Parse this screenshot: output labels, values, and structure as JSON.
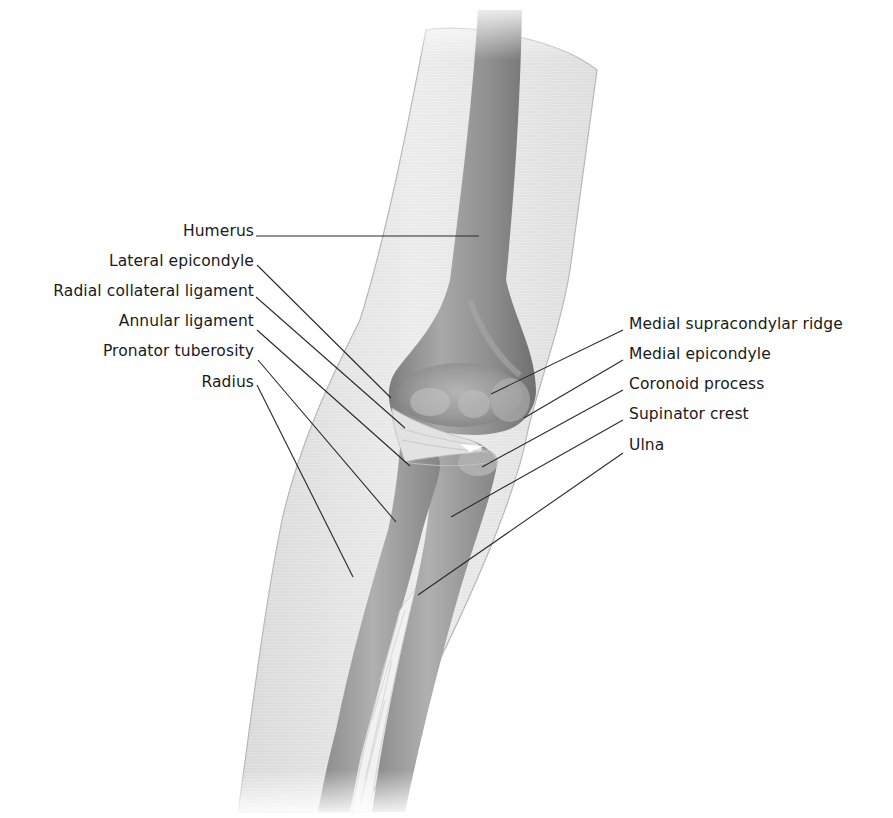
{
  "figure": {
    "colors": {
      "background": "#ffffff",
      "skin": "#e4e4e4",
      "skin_edge": "#b5b5b5",
      "bone": "#9a9a9a",
      "bone_dark": "#7c7c7c",
      "bone_light": "#bdbdbd",
      "ligament": "#dcdcdc",
      "leader_line": "#2a2a2a",
      "text": "#1a1a1a"
    }
  },
  "labels": {
    "left": [
      {
        "text": "Humerus",
        "x": 254,
        "y": 229
      },
      {
        "text": "Lateral epicondyle",
        "x": 254,
        "y": 260
      },
      {
        "text": "Radial collateral ligament",
        "x": 254,
        "y": 290
      },
      {
        "text": "Annular ligament",
        "x": 254,
        "y": 320
      },
      {
        "text": "Pronator tuberosity",
        "x": 254,
        "y": 350
      },
      {
        "text": "Radius",
        "x": 254,
        "y": 381
      }
    ],
    "right": [
      {
        "text": "Medial supracondylar ridge",
        "x": 629,
        "y": 323
      },
      {
        "text": "Medial epicondyle",
        "x": 629,
        "y": 353
      },
      {
        "text": "Coronoid process",
        "x": 629,
        "y": 383
      },
      {
        "text": "Supinator crest",
        "x": 629,
        "y": 413
      },
      {
        "text": "Ulna",
        "x": 629,
        "y": 443
      }
    ]
  },
  "leaders": {
    "left": [
      {
        "x1": 256,
        "y1": 236,
        "x2": 479,
        "y2": 236
      },
      {
        "x1": 257,
        "y1": 265,
        "x2": 391,
        "y2": 398
      },
      {
        "x1": 256,
        "y1": 297,
        "x2": 405,
        "y2": 428
      },
      {
        "x1": 257,
        "y1": 330,
        "x2": 410,
        "y2": 466
      },
      {
        "x1": 258,
        "y1": 360,
        "x2": 396,
        "y2": 522
      },
      {
        "x1": 257,
        "y1": 385,
        "x2": 353,
        "y2": 577
      }
    ],
    "right": [
      {
        "x1": 623,
        "y1": 330,
        "x2": 491,
        "y2": 394
      },
      {
        "x1": 623,
        "y1": 360,
        "x2": 524,
        "y2": 418
      },
      {
        "x1": 623,
        "y1": 390,
        "x2": 482,
        "y2": 467
      },
      {
        "x1": 623,
        "y1": 420,
        "x2": 451,
        "y2": 517
      },
      {
        "x1": 623,
        "y1": 453,
        "x2": 418,
        "y2": 595
      }
    ]
  }
}
